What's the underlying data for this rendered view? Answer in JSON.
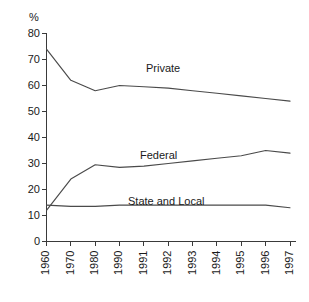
{
  "chart_data": {
    "type": "line",
    "title": "",
    "subtitle": "",
    "xlabel": "",
    "ylabel": "%",
    "ylim": [
      0,
      80
    ],
    "ytick_values": [
      0,
      10,
      20,
      30,
      40,
      50,
      60,
      70,
      80
    ],
    "ytick_labels": [
      "0",
      "10",
      "20",
      "30",
      "40",
      "50",
      "60",
      "70",
      "80"
    ],
    "grid": false,
    "legend_position": "inline-labels",
    "categories": [
      "1960",
      "1970",
      "1980",
      "1990",
      "1991",
      "1992",
      "1993",
      "1994",
      "1995",
      "1996",
      "1997"
    ],
    "series": [
      {
        "name": "Private",
        "label": "Private",
        "color": "#4a4a4a",
        "values": [
          74,
          62,
          58,
          60,
          59.5,
          59,
          58,
          57,
          56,
          55,
          54
        ]
      },
      {
        "name": "Federal",
        "label": "Federal",
        "color": "#4a4a4a",
        "values": [
          12,
          24,
          29.5,
          28.5,
          29,
          30,
          31,
          32,
          33,
          35,
          34
        ]
      },
      {
        "name": "State and Local",
        "label": "State and Local",
        "color": "#4a4a4a",
        "values": [
          14,
          13.5,
          13.5,
          14,
          14,
          14,
          14,
          14,
          14,
          14,
          13
        ]
      }
    ],
    "annotations": [
      {
        "id": "private",
        "text": "Private",
        "x_category": "1990",
        "y_value": 63.5
      },
      {
        "id": "federal",
        "text": "Federal",
        "x_category": "1990",
        "y_value": 36
      },
      {
        "id": "state-local",
        "text": "State and Local",
        "x_category": "1990",
        "y_value": 18.5
      }
    ]
  },
  "axes": {
    "y_unit_label": "%"
  }
}
